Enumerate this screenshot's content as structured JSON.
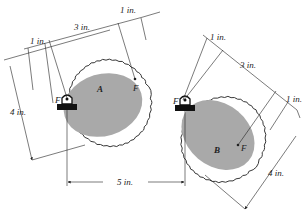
{
  "diagram": {
    "type": "mechanical-diagram",
    "gears": [
      {
        "id": "gear-a",
        "label": "A",
        "pivot_focus_label": "F",
        "free_focus_label": "F",
        "dimensions": {
          "focus_offset_left": "1 in.",
          "focus_spacing": "3 in.",
          "focus_offset_right": "1 in.",
          "minor_axis": "4 in."
        }
      },
      {
        "id": "gear-b",
        "label": "B",
        "pivot_focus_label": "F",
        "free_focus_label": "F",
        "dimensions": {
          "focus_offset_left": "1 in.",
          "focus_spacing": "3 in.",
          "focus_offset_right": "1 in.",
          "minor_axis": "4 in."
        }
      }
    ],
    "pivot_distance": "5 in.",
    "colors": {
      "ellipse_fill": "#a9a9a9",
      "line": "#222222",
      "support": "#111111"
    }
  }
}
